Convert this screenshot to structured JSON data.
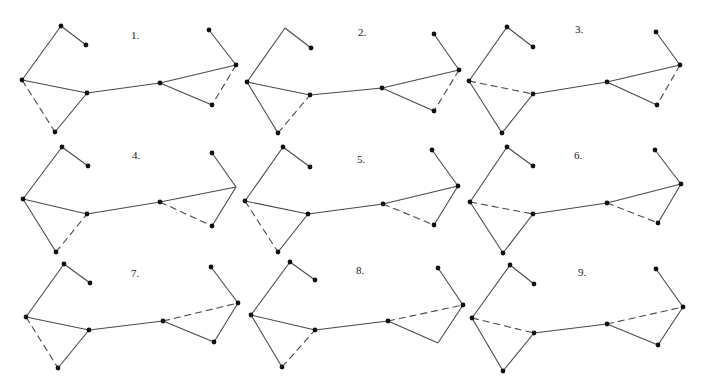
{
  "figure": {
    "edge_color": "#4a4a4a",
    "node_color": "#111111",
    "panels": [
      {
        "label": "1.",
        "label_pos": [
          131,
          30
        ],
        "nodes": {
          "apex": [
            61,
            26
          ],
          "tail": [
            86,
            45
          ],
          "left": [
            22,
            80
          ],
          "cl": [
            87,
            93
          ],
          "bottom": [
            55,
            132
          ],
          "cr": [
            160,
            83
          ],
          "rapex": [
            236,
            65
          ],
          "rtop": [
            209,
            30
          ],
          "br": [
            212,
            105
          ]
        },
        "hidden_nodes": [],
        "edges": [
          [
            "apex",
            "tail",
            "solid"
          ],
          [
            "apex",
            "left",
            "solid"
          ],
          [
            "left",
            "cl",
            "solid"
          ],
          [
            "left",
            "bottom",
            "dashed"
          ],
          [
            "bottom",
            "cl",
            "solid"
          ],
          [
            "cl",
            "cr",
            "solid"
          ],
          [
            "cr",
            "rapex",
            "solid"
          ],
          [
            "cr",
            "br",
            "solid"
          ],
          [
            "rapex",
            "br",
            "dashed"
          ],
          [
            "rapex",
            "rtop",
            "solid"
          ]
        ]
      },
      {
        "label": "2.",
        "label_pos": [
          358,
          27
        ],
        "nodes": {
          "apex": [
            285,
            28
          ],
          "tail": [
            311,
            48
          ],
          "left": [
            247,
            82
          ],
          "cl": [
            310,
            95
          ],
          "bottom": [
            278,
            133
          ],
          "cr": [
            382,
            88
          ],
          "rapex": [
            459,
            70
          ],
          "rtop": [
            434,
            34
          ],
          "br": [
            434,
            111
          ]
        },
        "hidden_nodes": [
          "apex"
        ],
        "edges": [
          [
            "apex",
            "tail",
            "solid"
          ],
          [
            "apex",
            "left",
            "solid"
          ],
          [
            "left",
            "cl",
            "solid"
          ],
          [
            "left",
            "bottom",
            "solid"
          ],
          [
            "bottom",
            "cl",
            "dashed"
          ],
          [
            "cl",
            "cr",
            "solid"
          ],
          [
            "cr",
            "rapex",
            "solid"
          ],
          [
            "cr",
            "br",
            "solid"
          ],
          [
            "rapex",
            "br",
            "dashed"
          ],
          [
            "rapex",
            "rtop",
            "solid"
          ]
        ]
      },
      {
        "label": "3.",
        "label_pos": [
          575,
          24
        ],
        "nodes": {
          "apex": [
            507,
            27
          ],
          "tail": [
            533,
            47
          ],
          "left": [
            469,
            81
          ],
          "cl": [
            533,
            94
          ],
          "bottom": [
            502,
            133
          ],
          "cr": [
            607,
            82
          ],
          "rapex": [
            680,
            65
          ],
          "rtop": [
            656,
            32
          ],
          "br": [
            657,
            105
          ]
        },
        "hidden_nodes": [],
        "edges": [
          [
            "apex",
            "tail",
            "solid"
          ],
          [
            "apex",
            "left",
            "solid"
          ],
          [
            "left",
            "cl",
            "dashed"
          ],
          [
            "left",
            "bottom",
            "solid"
          ],
          [
            "bottom",
            "cl",
            "solid"
          ],
          [
            "cl",
            "cr",
            "solid"
          ],
          [
            "cr",
            "rapex",
            "solid"
          ],
          [
            "cr",
            "br",
            "solid"
          ],
          [
            "rapex",
            "br",
            "dashed"
          ],
          [
            "rapex",
            "rtop",
            "solid"
          ]
        ]
      },
      {
        "label": "4.",
        "label_pos": [
          132,
          150
        ],
        "nodes": {
          "apex": [
            62,
            147
          ],
          "tail": [
            88,
            166
          ],
          "left": [
            23,
            199
          ],
          "cl": [
            87,
            214
          ],
          "bottom": [
            56,
            252
          ],
          "cr": [
            160,
            202
          ],
          "rapex": [
            236,
            187
          ],
          "rtop": [
            212,
            153
          ],
          "br": [
            212,
            226
          ]
        },
        "hidden_nodes": [
          "rapex"
        ],
        "edges": [
          [
            "apex",
            "tail",
            "solid"
          ],
          [
            "apex",
            "left",
            "solid"
          ],
          [
            "left",
            "cl",
            "solid"
          ],
          [
            "left",
            "bottom",
            "solid"
          ],
          [
            "bottom",
            "cl",
            "dashed"
          ],
          [
            "cl",
            "cr",
            "solid"
          ],
          [
            "cr",
            "rapex",
            "solid"
          ],
          [
            "cr",
            "br",
            "dashed"
          ],
          [
            "rapex",
            "br",
            "solid"
          ],
          [
            "rapex",
            "rtop",
            "solid"
          ]
        ]
      },
      {
        "label": "5.",
        "label_pos": [
          357,
          154
        ],
        "nodes": {
          "apex": [
            283,
            147
          ],
          "tail": [
            310,
            167
          ],
          "left": [
            245,
            201
          ],
          "cl": [
            308,
            214
          ],
          "bottom": [
            278,
            252
          ],
          "cr": [
            383,
            204
          ],
          "rapex": [
            458,
            186
          ],
          "rtop": [
            432,
            150
          ],
          "br": [
            434,
            225
          ]
        },
        "hidden_nodes": [],
        "edges": [
          [
            "apex",
            "tail",
            "solid"
          ],
          [
            "apex",
            "left",
            "solid"
          ],
          [
            "left",
            "cl",
            "solid"
          ],
          [
            "left",
            "bottom",
            "dashed"
          ],
          [
            "bottom",
            "cl",
            "solid"
          ],
          [
            "cl",
            "cr",
            "solid"
          ],
          [
            "cr",
            "rapex",
            "solid"
          ],
          [
            "cr",
            "br",
            "dashed"
          ],
          [
            "rapex",
            "br",
            "solid"
          ],
          [
            "rapex",
            "rtop",
            "solid"
          ]
        ]
      },
      {
        "label": "6.",
        "label_pos": [
          574,
          150
        ],
        "nodes": {
          "apex": [
            507,
            147
          ],
          "tail": [
            533,
            166
          ],
          "left": [
            470,
            202
          ],
          "cl": [
            533,
            214
          ],
          "bottom": [
            503,
            253
          ],
          "cr": [
            607,
            203
          ],
          "rapex": [
            681,
            184
          ],
          "rtop": [
            655,
            150
          ],
          "br": [
            658,
            223
          ]
        },
        "hidden_nodes": [],
        "edges": [
          [
            "apex",
            "tail",
            "solid"
          ],
          [
            "apex",
            "left",
            "solid"
          ],
          [
            "left",
            "cl",
            "dashed"
          ],
          [
            "left",
            "bottom",
            "solid"
          ],
          [
            "bottom",
            "cl",
            "solid"
          ],
          [
            "cl",
            "cr",
            "solid"
          ],
          [
            "cr",
            "rapex",
            "solid"
          ],
          [
            "cr",
            "br",
            "dashed"
          ],
          [
            "rapex",
            "br",
            "solid"
          ],
          [
            "rapex",
            "rtop",
            "solid"
          ]
        ]
      },
      {
        "label": "7.",
        "label_pos": [
          131,
          268
        ],
        "nodes": {
          "apex": [
            64,
            264
          ],
          "tail": [
            90,
            283
          ],
          "left": [
            26,
            317
          ],
          "cl": [
            89,
            330
          ],
          "bottom": [
            58,
            368
          ],
          "cr": [
            163,
            321
          ],
          "rapex": [
            238,
            303
          ],
          "rtop": [
            211,
            267
          ],
          "br": [
            214,
            342
          ]
        },
        "hidden_nodes": [],
        "edges": [
          [
            "apex",
            "tail",
            "solid"
          ],
          [
            "apex",
            "left",
            "solid"
          ],
          [
            "left",
            "cl",
            "solid"
          ],
          [
            "left",
            "bottom",
            "dashed"
          ],
          [
            "bottom",
            "cl",
            "solid"
          ],
          [
            "cl",
            "cr",
            "solid"
          ],
          [
            "cr",
            "rapex",
            "dashed"
          ],
          [
            "cr",
            "br",
            "solid"
          ],
          [
            "rapex",
            "br",
            "solid"
          ],
          [
            "rapex",
            "rtop",
            "solid"
          ]
        ]
      },
      {
        "label": "8.",
        "label_pos": [
          356,
          265
        ],
        "nodes": {
          "apex": [
            290,
            262
          ],
          "tail": [
            315,
            280
          ],
          "left": [
            251,
            315
          ],
          "cl": [
            315,
            330
          ],
          "bottom": [
            282,
            367
          ],
          "cr": [
            388,
            321
          ],
          "rapex": [
            463,
            305
          ],
          "rtop": [
            438,
            268
          ],
          "br": [
            438,
            343
          ]
        },
        "hidden_nodes": [
          "br"
        ],
        "edges": [
          [
            "apex",
            "tail",
            "solid"
          ],
          [
            "apex",
            "left",
            "solid"
          ],
          [
            "left",
            "cl",
            "solid"
          ],
          [
            "left",
            "bottom",
            "solid"
          ],
          [
            "bottom",
            "cl",
            "dashed"
          ],
          [
            "cl",
            "cr",
            "solid"
          ],
          [
            "cr",
            "rapex",
            "dashed"
          ],
          [
            "cr",
            "br",
            "solid"
          ],
          [
            "rapex",
            "br",
            "solid"
          ],
          [
            "rapex",
            "rtop",
            "solid"
          ]
        ]
      },
      {
        "label": "9.",
        "label_pos": [
          578,
          267
        ],
        "nodes": {
          "apex": [
            510,
            265
          ],
          "tail": [
            534,
            284
          ],
          "left": [
            472,
            318
          ],
          "cl": [
            534,
            333
          ],
          "bottom": [
            503,
            371
          ],
          "cr": [
            607,
            324
          ],
          "rapex": [
            683,
            307
          ],
          "rtop": [
            656,
            269
          ],
          "br": [
            658,
            345
          ]
        },
        "hidden_nodes": [],
        "edges": [
          [
            "apex",
            "tail",
            "solid"
          ],
          [
            "apex",
            "left",
            "solid"
          ],
          [
            "left",
            "cl",
            "dashed"
          ],
          [
            "left",
            "bottom",
            "solid"
          ],
          [
            "bottom",
            "cl",
            "solid"
          ],
          [
            "cl",
            "cr",
            "solid"
          ],
          [
            "cr",
            "rapex",
            "dashed"
          ],
          [
            "cr",
            "br",
            "solid"
          ],
          [
            "rapex",
            "br",
            "solid"
          ],
          [
            "rapex",
            "rtop",
            "solid"
          ]
        ]
      }
    ]
  }
}
